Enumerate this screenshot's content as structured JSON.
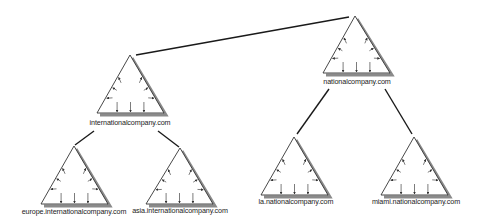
{
  "diagram": {
    "type": "domain-tree",
    "colors": {
      "line": "#1a1a1a",
      "triangle_stroke": "#333333",
      "triangle_shadow": "#8a8a8a",
      "background": "#ffffff"
    },
    "nodes": [
      {
        "id": "national",
        "label": "nationalcompany.com",
        "icon": "domain-triangle-icon",
        "apex": [
          355,
          16
        ],
        "base_left": [
          323,
          73
        ],
        "base_right": [
          390,
          73
        ],
        "label_pos": [
          357,
          84
        ]
      },
      {
        "id": "international",
        "label": "internationalcompany.com",
        "icon": "domain-triangle-icon",
        "apex": [
          130,
          55
        ],
        "base_left": [
          97,
          113
        ],
        "base_right": [
          164,
          113
        ],
        "label_pos": [
          130,
          125
        ]
      },
      {
        "id": "europe",
        "label": "europe.internationalcompany.com",
        "icon": "domain-triangle-icon",
        "apex": [
          74,
          146
        ],
        "base_left": [
          41,
          204
        ],
        "base_right": [
          108,
          204
        ],
        "label_pos": [
          74,
          214
        ]
      },
      {
        "id": "asia",
        "label": "asia.internationalcompany.com",
        "icon": "domain-triangle-icon",
        "apex": [
          180,
          148
        ],
        "base_left": [
          146,
          204
        ],
        "base_right": [
          213,
          204
        ],
        "label_pos": [
          180,
          213
        ]
      },
      {
        "id": "la",
        "label": "la.nationalcompany.com",
        "icon": "domain-triangle-icon",
        "apex": [
          294,
          137
        ],
        "base_left": [
          261,
          195
        ],
        "base_right": [
          328,
          195
        ],
        "label_pos": [
          296,
          204
        ]
      },
      {
        "id": "miami",
        "label": "miami.nationalcompany.com",
        "icon": "domain-triangle-icon",
        "apex": [
          414,
          137
        ],
        "base_left": [
          381,
          195
        ],
        "base_right": [
          448,
          195
        ],
        "label_pos": [
          416,
          204
        ]
      }
    ],
    "edges": [
      {
        "from": "national",
        "to": "international",
        "points": [
          [
            349,
            17
          ],
          [
            136,
            55
          ]
        ]
      },
      {
        "from": "national",
        "to": "la",
        "points": [
          [
            329,
            89
          ],
          [
            297,
            134
          ]
        ]
      },
      {
        "from": "national",
        "to": "miami",
        "points": [
          [
            385,
            89
          ],
          [
            412,
            134
          ]
        ]
      },
      {
        "from": "international",
        "to": "europe",
        "points": [
          [
            94,
            131
          ],
          [
            75,
            145
          ]
        ]
      },
      {
        "from": "international",
        "to": "asia",
        "points": [
          [
            158,
            131
          ],
          [
            179,
            147
          ]
        ]
      }
    ]
  }
}
